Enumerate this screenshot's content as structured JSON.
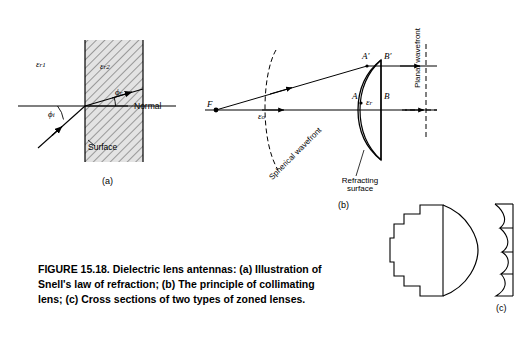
{
  "figure": {
    "caption": "FIGURE 15.18.   Dielectric lens antennas: (a) Illustration of Snell's law of refraction; (b) The principle of collimating lens; (c) Cross sections of two types of zoned lenses.",
    "panels": {
      "a": "(a)",
      "b": "(b)",
      "c": "(c)"
    }
  },
  "panel_a": {
    "eps_r1": "ε",
    "eps_r1_sub": "r1",
    "eps_r2": "ε",
    "eps_r2_sub": "r2",
    "phi_i": "ϕ",
    "phi_i_sub": "i",
    "phi_r": "ϕ",
    "phi_r_sub": "r",
    "normal": "Normal",
    "surface": "Surface"
  },
  "panel_b": {
    "focus": "F",
    "point_A": "A",
    "point_A_prime": "A′",
    "point_B": "B",
    "point_B_prime": "B′",
    "eps_o": "ε",
    "eps_o_sub": "o",
    "eps_r": "ε",
    "eps_r_sub": "r",
    "spherical_wavefront": "Spherical wavefront",
    "planar_wavefront": "Planar wavefront",
    "refracting_surface": "Refracting surface"
  },
  "colors": {
    "ink": "#000000",
    "hatch": "#6b6b6b",
    "paper": "#ffffff",
    "shade": "#d9d9d9"
  }
}
